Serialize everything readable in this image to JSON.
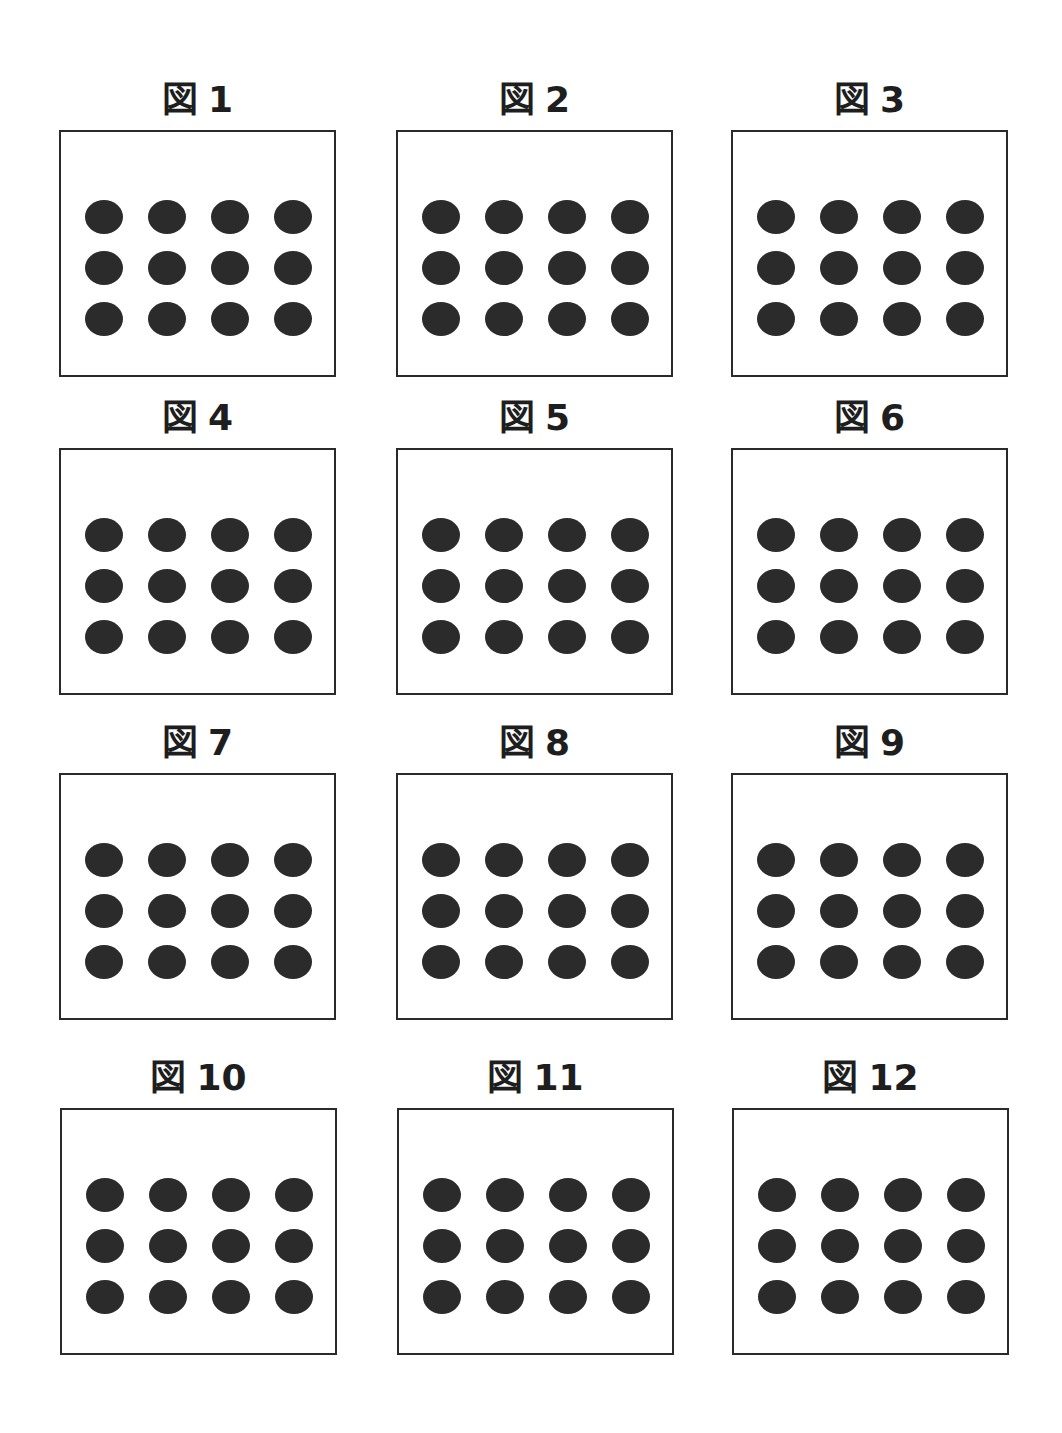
{
  "figures": [
    {
      "label_prefix": "図",
      "label_number": "1",
      "rows": 3,
      "cols": 4,
      "dot_count": 12
    },
    {
      "label_prefix": "図",
      "label_number": "2",
      "rows": 3,
      "cols": 4,
      "dot_count": 12
    },
    {
      "label_prefix": "図",
      "label_number": "3",
      "rows": 3,
      "cols": 4,
      "dot_count": 12
    },
    {
      "label_prefix": "図",
      "label_number": "4",
      "rows": 3,
      "cols": 4,
      "dot_count": 12
    },
    {
      "label_prefix": "図",
      "label_number": "5",
      "rows": 3,
      "cols": 4,
      "dot_count": 12
    },
    {
      "label_prefix": "図",
      "label_number": "6",
      "rows": 3,
      "cols": 4,
      "dot_count": 12
    },
    {
      "label_prefix": "図",
      "label_number": "7",
      "rows": 3,
      "cols": 4,
      "dot_count": 12
    },
    {
      "label_prefix": "図",
      "label_number": "8",
      "rows": 3,
      "cols": 4,
      "dot_count": 12
    },
    {
      "label_prefix": "図",
      "label_number": "9",
      "rows": 3,
      "cols": 4,
      "dot_count": 12
    },
    {
      "label_prefix": "図",
      "label_number": "10",
      "rows": 3,
      "cols": 4,
      "dot_count": 12
    },
    {
      "label_prefix": "図",
      "label_number": "11",
      "rows": 3,
      "cols": 4,
      "dot_count": 12
    },
    {
      "label_prefix": "図",
      "label_number": "12",
      "rows": 3,
      "cols": 4,
      "dot_count": 12
    }
  ],
  "colors": {
    "dot": "#2b2b2b",
    "border": "#2a2a2a",
    "background": "#ffffff"
  }
}
